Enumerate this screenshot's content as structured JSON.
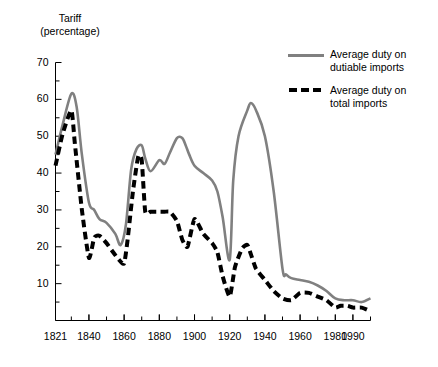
{
  "chart_data": {
    "type": "line",
    "title": "Tariff (percentage)",
    "title_lines": [
      "Tariff",
      "(percentage)"
    ],
    "xlabel": "",
    "ylabel": "Tariff (percentage)",
    "xlim": [
      1821,
      2000
    ],
    "ylim": [
      0,
      70
    ],
    "yticks": [
      0,
      10,
      20,
      30,
      40,
      50,
      60,
      70
    ],
    "ytick_labels": [
      "",
      "10",
      "20",
      "30",
      "40",
      "50",
      "60",
      "70"
    ],
    "y_minor_tick_step": 5,
    "xticks": [
      1821,
      1840,
      1860,
      1880,
      1900,
      1920,
      1940,
      1960,
      1980,
      1990
    ],
    "xtick_labels": [
      "1821",
      "1840",
      "1860",
      "1880",
      "1900",
      "1920",
      "1940",
      "1960",
      "1980",
      "1990"
    ],
    "x_minor_tick_step": 10,
    "grid": false,
    "legend_position": "upper right",
    "colors": {
      "dutiable": "#808080",
      "total": "#000000"
    },
    "series": [
      {
        "name": "Average duty on dutiable imports",
        "label_lines": [
          "Average duty on",
          "dutiable imports"
        ],
        "style": "solid",
        "color": "#808080",
        "x": [
          1821,
          1825,
          1830,
          1833,
          1836,
          1840,
          1843,
          1846,
          1850,
          1855,
          1858,
          1861,
          1864,
          1867,
          1870,
          1872,
          1875,
          1880,
          1883,
          1886,
          1890,
          1893,
          1895,
          1897,
          1900,
          1905,
          1910,
          1913,
          1916,
          1920,
          1922,
          1925,
          1930,
          1932,
          1935,
          1940,
          1945,
          1950,
          1952,
          1955,
          1960,
          1965,
          1970,
          1975,
          1980,
          1985,
          1990,
          1995,
          2000
        ],
        "y": [
          45.0,
          53.0,
          61.5,
          58.0,
          45.0,
          32.0,
          30.0,
          27.5,
          26.5,
          23.5,
          20.5,
          26.0,
          41.0,
          46.5,
          47.5,
          44.0,
          40.5,
          43.5,
          42.5,
          45.5,
          49.5,
          49.5,
          47.5,
          45.0,
          42.0,
          40.0,
          38.0,
          35.0,
          28.0,
          16.5,
          38.0,
          50.0,
          57.0,
          59.0,
          57.0,
          50.0,
          35.0,
          14.0,
          12.5,
          11.5,
          11.0,
          10.5,
          9.5,
          8.0,
          6.0,
          5.5,
          5.5,
          5.0,
          6.0
        ]
      },
      {
        "name": "Average duty on total imports",
        "label_lines": [
          "Average duty on",
          "total imports"
        ],
        "style": "dashed",
        "color": "#000000",
        "x": [
          1821,
          1825,
          1830,
          1832,
          1836,
          1840,
          1843,
          1846,
          1850,
          1853,
          1857,
          1860,
          1862,
          1865,
          1868,
          1870,
          1872,
          1875,
          1880,
          1883,
          1886,
          1890,
          1893,
          1896,
          1900,
          1905,
          1910,
          1913,
          1916,
          1920,
          1923,
          1927,
          1930,
          1932,
          1935,
          1940,
          1945,
          1950,
          1955,
          1960,
          1965,
          1970,
          1975,
          1980,
          1983,
          1987,
          1990,
          1995,
          2000
        ],
        "y": [
          42.0,
          50.5,
          57.0,
          48.0,
          30.0,
          17.0,
          22.5,
          23.0,
          21.0,
          19.0,
          16.5,
          15.5,
          22.0,
          35.0,
          44.5,
          43.5,
          29.5,
          29.5,
          29.5,
          29.5,
          29.5,
          27.0,
          22.0,
          20.0,
          27.5,
          23.5,
          21.0,
          18.5,
          12.0,
          6.5,
          14.5,
          19.5,
          20.5,
          18.0,
          14.0,
          11.0,
          8.0,
          6.0,
          5.5,
          7.5,
          7.5,
          6.5,
          5.5,
          3.5,
          4.0,
          4.0,
          3.5,
          3.5,
          2.5
        ]
      }
    ]
  },
  "legend": {
    "items": [
      {
        "label_line1": "Average duty on",
        "label_line2": "dutiable imports",
        "style": "solid"
      },
      {
        "label_line1": "Average duty on",
        "label_line2": "total imports",
        "style": "dashed"
      }
    ]
  }
}
